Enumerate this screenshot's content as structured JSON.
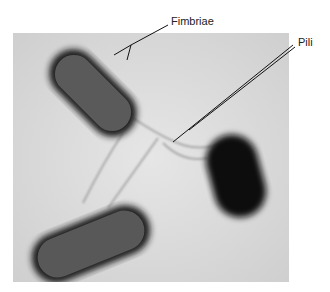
{
  "figure": {
    "labels": {
      "fimbriae": "Fimbriae",
      "pili": "Pili"
    },
    "colors": {
      "background": "#dcdcdc",
      "cell_body": "#555555",
      "cell_halo": "#1a1a1a",
      "leader_line": "#111111"
    }
  }
}
